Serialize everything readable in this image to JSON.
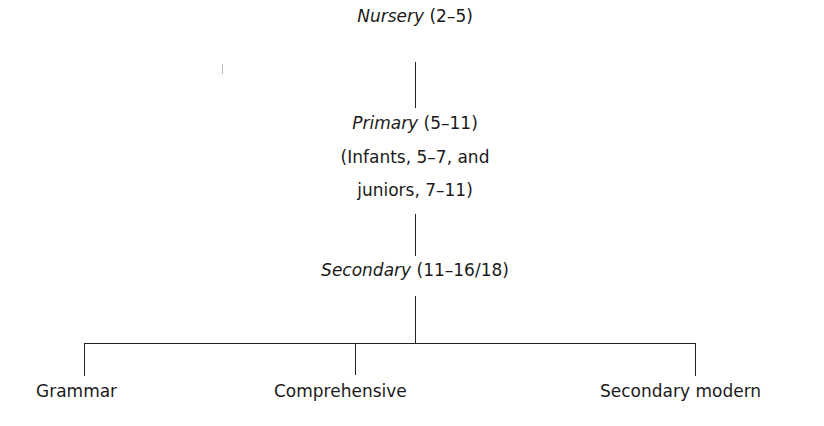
{
  "diagram": {
    "type": "hierarchy",
    "levels": [
      {
        "name": "Nursery",
        "range": "(2–5)"
      },
      {
        "name": "Primary",
        "range": "(5–11)",
        "note_line1": "(Infants, 5–7, and",
        "note_line2": "juniors, 7–11)"
      },
      {
        "name": "Secondary",
        "range": "(11–16/18)"
      }
    ],
    "branches": [
      "Grammar",
      "Comprehensive",
      "Secondary modern"
    ]
  }
}
